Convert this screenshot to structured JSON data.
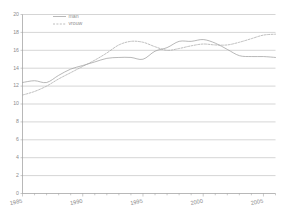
{
  "chart_data": {
    "type": "line",
    "title": "",
    "subtitle": "",
    "xlabel": "",
    "ylabel": "",
    "xlim": [
      1985,
      2006
    ],
    "ylim": [
      0,
      20
    ],
    "grid": true,
    "legend_position": "top-left",
    "x": [
      1985,
      1986,
      1987,
      1988,
      1989,
      1990,
      1991,
      1992,
      1993,
      1994,
      1995,
      1996,
      1997,
      1998,
      1999,
      2000,
      2001,
      2002,
      2003,
      2004,
      2005,
      2006
    ],
    "xticks": [
      1985,
      1990,
      1995,
      2000,
      2005
    ],
    "xticklabels": [
      "1985",
      "1990",
      "1995",
      "2000",
      "2005"
    ],
    "yticks": [
      0,
      2,
      4,
      6,
      8,
      10,
      12,
      14,
      16,
      18,
      20
    ],
    "yticklabels": [
      "0",
      "2",
      "4",
      "6",
      "8",
      "10",
      "12",
      "14",
      "16",
      "18",
      "20"
    ],
    "series": [
      {
        "name": "man",
        "style": "solid",
        "color": "#a0a0a0",
        "values": [
          12.4,
          12.6,
          12.4,
          13.2,
          13.9,
          14.3,
          14.7,
          15.1,
          15.2,
          15.2,
          15.0,
          15.9,
          16.3,
          17.0,
          17.0,
          17.2,
          16.8,
          16.1,
          15.4,
          15.3,
          15.3,
          15.2
        ]
      },
      {
        "name": "vrouw",
        "style": "dashed",
        "color": "#a8a8a8",
        "values": [
          11.0,
          11.4,
          12.0,
          12.8,
          13.5,
          14.2,
          14.9,
          15.7,
          16.6,
          17.0,
          16.9,
          16.4,
          16.0,
          16.2,
          16.5,
          16.7,
          16.6,
          16.6,
          16.9,
          17.3,
          17.7,
          17.8
        ]
      }
    ],
    "legend": [
      {
        "label": "man",
        "style": "solid"
      },
      {
        "label": "vrouw",
        "style": "dashed"
      }
    ]
  },
  "colors": {
    "grid": "#b9b9b9",
    "axis": "#9a9a9a",
    "text": "#8c8c8c",
    "background": "#ffffff"
  }
}
